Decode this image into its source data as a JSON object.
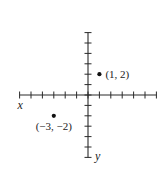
{
  "chart_data": {
    "type": "scatter",
    "title": "",
    "xlabel": "x",
    "ylabel": "y",
    "xlim": [
      -6,
      6
    ],
    "ylim": [
      -6,
      6
    ],
    "x_ticks": [
      -6,
      -5,
      -4,
      -3,
      -2,
      -1,
      0,
      1,
      2,
      3,
      4,
      5,
      6
    ],
    "y_ticks": [
      -6,
      -5,
      -4,
      -3,
      -2,
      -1,
      0,
      1,
      2,
      3,
      4,
      5,
      6
    ],
    "grid": false,
    "tick_labels_shown": false,
    "points": [
      {
        "x": 1,
        "y": 2,
        "label": "(1, 2)",
        "label_position": "right"
      },
      {
        "x": -3,
        "y": -2,
        "label": "(−3, −2)",
        "label_position": "below"
      }
    ],
    "axis_label_positions": {
      "x": "left-end-below",
      "y": "bottom-end-right"
    }
  },
  "labels": {
    "x_axis": "x",
    "y_axis": "y",
    "point_1": "(1, 2)",
    "point_2": "(−3, −2)"
  }
}
